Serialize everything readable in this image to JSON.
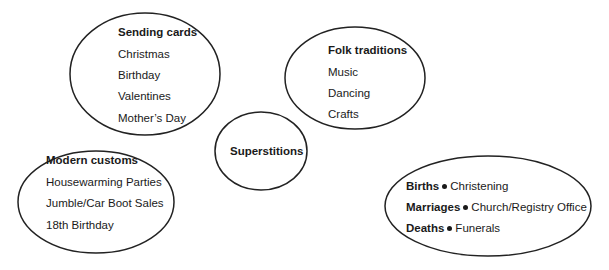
{
  "diagram": {
    "type": "bubble-mindmap",
    "stroke_color": "#222222",
    "bubbles": [
      {
        "id": "sending-cards",
        "title": "Sending cards",
        "items": [
          "Christmas",
          "Birthday",
          "Valentines",
          "Mother’s Day"
        ]
      },
      {
        "id": "folk-traditions",
        "title": "Folk traditions",
        "items": [
          "Music",
          "Dancing",
          "Crafts"
        ]
      },
      {
        "id": "superstitions",
        "title": "Superstitions",
        "items": []
      },
      {
        "id": "modern-customs",
        "title": "Modern customs",
        "items": [
          "Housewarming Parties",
          "Jumble/Car Boot Sales",
          "18th Birthday"
        ]
      },
      {
        "id": "life-events",
        "title": "",
        "pairs": [
          {
            "term": "Births",
            "detail": "Christening"
          },
          {
            "term": "Marriages",
            "detail": "Church/Registry Office"
          },
          {
            "term": "Deaths",
            "detail": "Funerals"
          }
        ]
      }
    ]
  }
}
